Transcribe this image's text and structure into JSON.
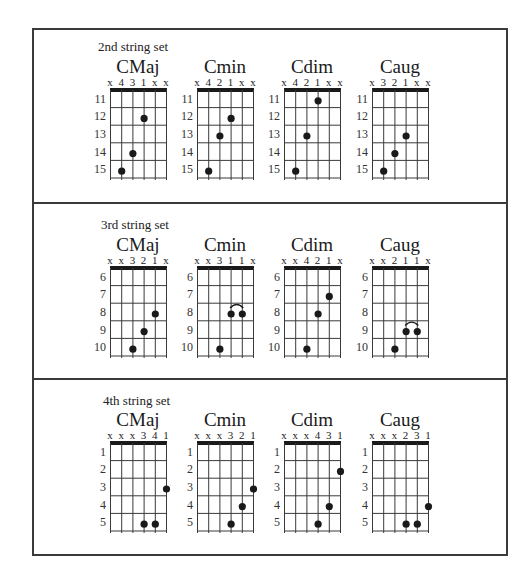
{
  "sections": [
    {
      "label": "2nd string set",
      "fret_numbers": [
        "11",
        "12",
        "13",
        "14",
        "15"
      ],
      "chords": [
        {
          "name": "CMaj",
          "fingering": [
            "x",
            "4",
            "3",
            "1",
            "x",
            "x"
          ],
          "dots": [
            {
              "string": 1,
              "fret": 5
            },
            {
              "string": 2,
              "fret": 4
            },
            {
              "string": 3,
              "fret": 2
            }
          ],
          "barre": null
        },
        {
          "name": "Cmin",
          "fingering": [
            "x",
            "4",
            "2",
            "1",
            "x",
            "x"
          ],
          "dots": [
            {
              "string": 1,
              "fret": 5
            },
            {
              "string": 2,
              "fret": 3
            },
            {
              "string": 3,
              "fret": 2
            }
          ],
          "barre": null
        },
        {
          "name": "Cdim",
          "fingering": [
            "x",
            "4",
            "2",
            "1",
            "x",
            "x"
          ],
          "dots": [
            {
              "string": 1,
              "fret": 5
            },
            {
              "string": 2,
              "fret": 3
            },
            {
              "string": 3,
              "fret": 1
            }
          ],
          "barre": null
        },
        {
          "name": "Caug",
          "fingering": [
            "x",
            "3",
            "2",
            "1",
            "x",
            "x"
          ],
          "dots": [
            {
              "string": 1,
              "fret": 5
            },
            {
              "string": 2,
              "fret": 4
            },
            {
              "string": 3,
              "fret": 3
            }
          ],
          "barre": null
        }
      ]
    },
    {
      "label": "3rd string set",
      "fret_numbers": [
        "6",
        "7",
        "8",
        "9",
        "10"
      ],
      "chords": [
        {
          "name": "CMaj",
          "fingering": [
            "x",
            "x",
            "3",
            "2",
            "1",
            "x"
          ],
          "dots": [
            {
              "string": 2,
              "fret": 5
            },
            {
              "string": 3,
              "fret": 4
            },
            {
              "string": 4,
              "fret": 3
            }
          ],
          "barre": null
        },
        {
          "name": "Cmin",
          "fingering": [
            "x",
            "x",
            "3",
            "1",
            "1",
            "x"
          ],
          "dots": [
            {
              "string": 2,
              "fret": 5
            },
            {
              "string": 3,
              "fret": 3
            },
            {
              "string": 4,
              "fret": 3
            }
          ],
          "barre": {
            "from": 3,
            "to": 4,
            "fret": 3
          }
        },
        {
          "name": "Cdim",
          "fingering": [
            "x",
            "x",
            "4",
            "2",
            "1",
            "x"
          ],
          "dots": [
            {
              "string": 2,
              "fret": 5
            },
            {
              "string": 3,
              "fret": 3
            },
            {
              "string": 4,
              "fret": 2
            }
          ],
          "barre": null
        },
        {
          "name": "Caug",
          "fingering": [
            "x",
            "x",
            "2",
            "1",
            "1",
            "x"
          ],
          "dots": [
            {
              "string": 2,
              "fret": 5
            },
            {
              "string": 3,
              "fret": 4
            },
            {
              "string": 4,
              "fret": 4
            }
          ],
          "barre": {
            "from": 3,
            "to": 4,
            "fret": 4
          }
        }
      ]
    },
    {
      "label": "4th string set",
      "fret_numbers": [
        "1",
        "2",
        "3",
        "4",
        "5"
      ],
      "chords": [
        {
          "name": "CMaj",
          "fingering": [
            "x",
            "x",
            "x",
            "3",
            "4",
            "1"
          ],
          "dots": [
            {
              "string": 3,
              "fret": 5
            },
            {
              "string": 4,
              "fret": 5
            },
            {
              "string": 5,
              "fret": 3
            }
          ],
          "barre": null
        },
        {
          "name": "Cmin",
          "fingering": [
            "x",
            "x",
            "x",
            "3",
            "2",
            "1"
          ],
          "dots": [
            {
              "string": 3,
              "fret": 5
            },
            {
              "string": 4,
              "fret": 4
            },
            {
              "string": 5,
              "fret": 3
            }
          ],
          "barre": null
        },
        {
          "name": "Cdim",
          "fingering": [
            "x",
            "x",
            "x",
            "4",
            "3",
            "1"
          ],
          "dots": [
            {
              "string": 3,
              "fret": 5
            },
            {
              "string": 4,
              "fret": 4
            },
            {
              "string": 5,
              "fret": 2
            }
          ],
          "barre": null
        },
        {
          "name": "Caug",
          "fingering": [
            "x",
            "x",
            "x",
            "2",
            "3",
            "1"
          ],
          "dots": [
            {
              "string": 3,
              "fret": 5
            },
            {
              "string": 4,
              "fret": 5
            },
            {
              "string": 5,
              "fret": 4
            }
          ],
          "barre": null
        }
      ]
    }
  ],
  "colors": {
    "ink": "#1a1a1a",
    "grid": "#3a3a3a",
    "border": "#3a3a3a",
    "background": "#ffffff"
  }
}
